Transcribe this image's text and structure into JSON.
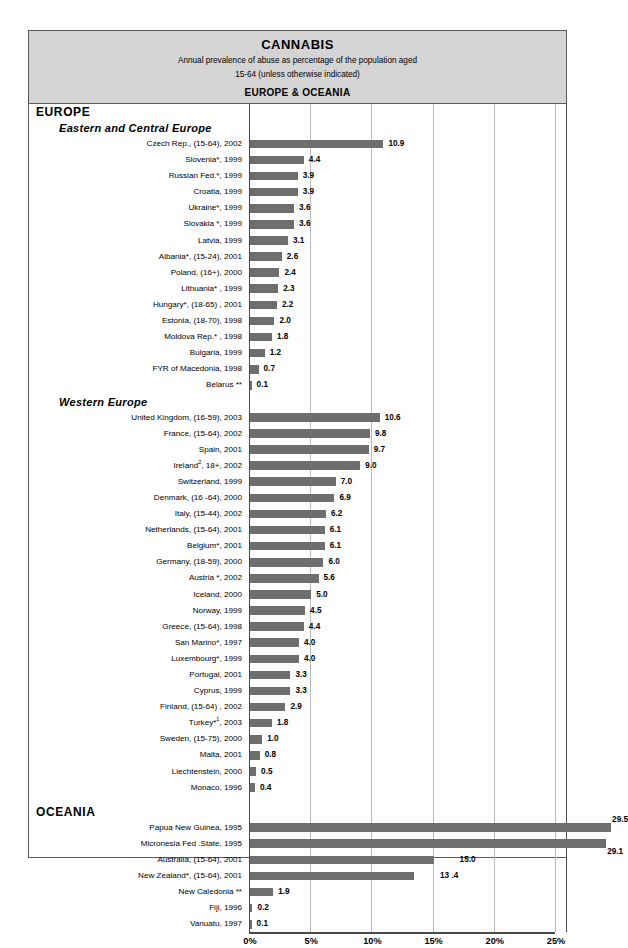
{
  "header": {
    "title": "CANNABIS",
    "subtitle_line1": "Annual prevalence of abuse as percentage of the population aged",
    "subtitle_line2": "15-64 (unless otherwise indicated)",
    "region_banner": "EUROPE & OCEANIA"
  },
  "groups": {
    "europe": "EUROPE",
    "eastern_central_europe": "Eastern and Central Europe",
    "western_europe": "Western Europe",
    "oceania": "OCEANIA"
  },
  "axis": {
    "ticks": [
      "0%",
      "5%",
      "10%",
      "15%",
      "20%",
      "25%"
    ],
    "tick_values": [
      0,
      5,
      10,
      15,
      20,
      25
    ],
    "min": 0,
    "max": 25.9
  },
  "colors": {
    "bar": "#6e6e6e",
    "header_bg": "#d4d4d4",
    "border": "#5a5a5a",
    "gridline": "#b9b9b9"
  },
  "chart_data": {
    "type": "bar",
    "orientation": "horizontal",
    "title": "CANNABIS",
    "subtitle": "Annual prevalence of abuse as percentage of the population aged 15-64 (unless otherwise indicated)",
    "region": "EUROPE & OCEANIA",
    "xlabel": "",
    "ylabel": "",
    "xlim": [
      0,
      25.9
    ],
    "xticks": [
      0,
      5,
      10,
      15,
      20,
      25
    ],
    "xticklabels": [
      "0%",
      "5%",
      "10%",
      "15%",
      "20%",
      "25%"
    ],
    "grid": true,
    "legend": "none",
    "sections": [
      {
        "name": "EUROPE",
        "subsections": [
          {
            "name": "Eastern and Central Europe",
            "categories": [
              "Czech Rep., (15-64), 2002",
              "Slovenia*, 1999",
              "Russian Fed.*, 1999",
              "Croatia, 1999",
              "Ukraine*, 1999",
              "Slovakia *, 1999",
              "Latvia, 1999",
              "Albania*, (15-24), 2001",
              "Poland, (16+), 2000",
              "Lithuania* , 1999",
              "Hungary*, (18-65) , 2001",
              "Estonia, (18-70), 1998",
              "Moldova Rep.* , 1998",
              "Bulgaria, 1999",
              "FYR of Macedonia, 1998",
              "Belarus **"
            ],
            "values": [
              10.9,
              4.4,
              3.9,
              3.9,
              3.6,
              3.6,
              3.1,
              2.6,
              2.4,
              2.3,
              2.2,
              2.0,
              1.8,
              1.2,
              0.7,
              0.1
            ]
          },
          {
            "name": "Western Europe",
            "categories": [
              "United Kingdom, (16-59), 2003",
              "France, (15-64), 2002",
              "Spain, 2001",
              "Ireland², 18+, 2002",
              "Switzerland, 1999",
              "Denmark, (16 -64), 2000",
              "Italy, (15-44), 2002",
              "Netherlands, (15-64), 2001",
              "Belgium*, 2001",
              "Germany, (18-59), 2000",
              "Austria *, 2002",
              "Iceland, 2000",
              "Norway, 1999",
              "Greece, (15-64), 1998",
              "San Marino*, 1997",
              "Luxembourg*, 1999",
              "Portugal, 2001",
              "Cyprus, 1999",
              "Finland, (15-64) , 2002",
              "Turkey*¹, 2003",
              "Sweden, (15-75), 2000",
              "Malta, 2001",
              "Liechtenstein, 2000",
              "Monaco, 1996"
            ],
            "values": [
              10.6,
              9.8,
              9.7,
              9.0,
              7.0,
              6.9,
              6.2,
              6.1,
              6.1,
              6.0,
              5.6,
              5.0,
              4.5,
              4.4,
              4.0,
              4.0,
              3.3,
              3.3,
              2.9,
              1.8,
              1.0,
              0.8,
              0.5,
              0.4
            ]
          }
        ]
      },
      {
        "name": "OCEANIA",
        "subsections": [
          {
            "name": "",
            "categories": [
              "Papua New Guinea, 1995",
              "Micronesia Fed .State, 1995",
              "Australia, (15-64), 2001",
              "New Zealand*, (15-64), 2001",
              "New Caledonia **",
              "Fiji, 1996",
              "Vanuatu, 1997"
            ],
            "values": [
              29.5,
              29.1,
              15.0,
              13.4,
              1.9,
              0.2,
              0.1
            ]
          }
        ]
      }
    ]
  },
  "rows": [
    {
      "label": "Czech Rep., (15-64), 2002",
      "value": 10.9,
      "display": "10.9"
    },
    {
      "label": "Slovenia*, 1999",
      "value": 4.4,
      "display": "4.4"
    },
    {
      "label": "Russian Fed.*, 1999",
      "value": 3.9,
      "display": "3.9"
    },
    {
      "label": "Croatia, 1999",
      "value": 3.9,
      "display": "3.9"
    },
    {
      "label": "Ukraine*, 1999",
      "value": 3.6,
      "display": "3.6"
    },
    {
      "label": "Slovakia *, 1999",
      "value": 3.6,
      "display": "3.6"
    },
    {
      "label": "Latvia, 1999",
      "value": 3.1,
      "display": "3.1"
    },
    {
      "label": "Albania*, (15-24), 2001",
      "value": 2.6,
      "display": "2.6"
    },
    {
      "label": "Poland, (16+), 2000",
      "value": 2.4,
      "display": "2.4"
    },
    {
      "label": "Lithuania* , 1999",
      "value": 2.3,
      "display": "2.3"
    },
    {
      "label": "Hungary*, (18-65) , 2001",
      "value": 2.2,
      "display": "2.2"
    },
    {
      "label": "Estonia, (18-70), 1998",
      "value": 2.0,
      "display": "2.0"
    },
    {
      "label": "Moldova Rep.* , 1998",
      "value": 1.8,
      "display": "1.8"
    },
    {
      "label": "Bulgaria, 1999",
      "value": 1.2,
      "display": "1.2"
    },
    {
      "label": "FYR of Macedonia, 1998",
      "value": 0.7,
      "display": "0.7"
    },
    {
      "label": "Belarus **",
      "value": 0.1,
      "display": "0.1"
    },
    {
      "label": "United Kingdom, (16-59), 2003",
      "value": 10.6,
      "display": "10.6"
    },
    {
      "label": "France, (15-64), 2002",
      "value": 9.8,
      "display": "9.8"
    },
    {
      "label": "Spain, 2001",
      "value": 9.7,
      "display": "9.7"
    },
    {
      "label": "Ireland, 18+, 2002",
      "value": 9.0,
      "display": "9.0"
    },
    {
      "label": "Switzerland, 1999",
      "value": 7.0,
      "display": "7.0"
    },
    {
      "label": "Denmark, (16 -64), 2000",
      "value": 6.9,
      "display": "6.9"
    },
    {
      "label": "Italy, (15-44), 2002",
      "value": 6.2,
      "display": "6.2"
    },
    {
      "label": "Netherlands, (15-64), 2001",
      "value": 6.1,
      "display": "6.1"
    },
    {
      "label": "Belgium*, 2001",
      "value": 6.1,
      "display": "6.1"
    },
    {
      "label": "Germany, (18-59), 2000",
      "value": 6.0,
      "display": "6.0"
    },
    {
      "label": "Austria *, 2002",
      "value": 5.6,
      "display": "5.6"
    },
    {
      "label": "Iceland, 2000",
      "value": 5.0,
      "display": "5.0"
    },
    {
      "label": "Norway, 1999",
      "value": 4.5,
      "display": "4.5"
    },
    {
      "label": "Greece, (15-64), 1998",
      "value": 4.4,
      "display": "4.4"
    },
    {
      "label": "San Marino*, 1997",
      "value": 4.0,
      "display": "4.0"
    },
    {
      "label": "Luxembourg*, 1999",
      "value": 4.0,
      "display": "4.0"
    },
    {
      "label": "Portugal, 2001",
      "value": 3.3,
      "display": "3.3"
    },
    {
      "label": "Cyprus, 1999",
      "value": 3.3,
      "display": "3.3"
    },
    {
      "label": "Finland, (15-64) , 2002",
      "value": 2.9,
      "display": "2.9"
    },
    {
      "label": "Turkey*, 2003",
      "value": 1.8,
      "display": "1.8"
    },
    {
      "label": "Sweden, (15-75), 2000",
      "value": 1.0,
      "display": "1.0"
    },
    {
      "label": "Malta, 2001",
      "value": 0.8,
      "display": "0.8"
    },
    {
      "label": "Liechtenstein, 2000",
      "value": 0.5,
      "display": "0.5"
    },
    {
      "label": "Monaco, 1996",
      "value": 0.4,
      "display": "0.4"
    },
    {
      "label": "Papua New Guinea, 1995",
      "value": 29.5,
      "display": "29.5"
    },
    {
      "label": "Micronesia Fed .State, 1995",
      "value": 29.1,
      "display": "29.1"
    },
    {
      "label": "Australia, (15-64), 2001",
      "value": 15.0,
      "display": "15.0"
    },
    {
      "label": "New Zealand*, (15-64), 2001",
      "value": 13.4,
      "display": "13 .4"
    },
    {
      "label": "New Caledonia **",
      "value": 1.9,
      "display": "1.9"
    },
    {
      "label": "Fiji, 1996",
      "value": 0.2,
      "display": "0.2"
    },
    {
      "label": "Vanuatu, 1997",
      "value": 0.1,
      "display": "0.1"
    }
  ]
}
